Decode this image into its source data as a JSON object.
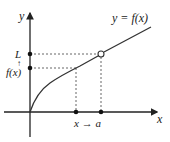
{
  "diagram": {
    "type": "limit-of-function-graph",
    "curve_label": "y = f(x)",
    "axes": {
      "x_label": "x",
      "y_label": "y"
    },
    "y_axis_labels": {
      "limit": "L",
      "value": "f(x)",
      "arrow": "↑"
    },
    "x_axis_labels": {
      "approach": "x → a"
    },
    "colors": {
      "axis": "#222222",
      "curve": "#333333",
      "dashed": "#555555",
      "background": "#ffffff"
    }
  }
}
